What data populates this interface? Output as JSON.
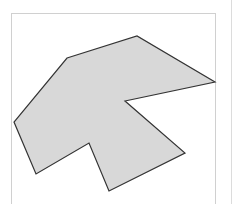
{
  "diagram": {
    "type": "polygon",
    "fill": "#d8d8d8",
    "stroke": "#333333",
    "stroke_width": 1.2,
    "points": [
      [
        67,
        58
      ],
      [
        137,
        36
      ],
      [
        215,
        82
      ],
      [
        125,
        101
      ],
      [
        185,
        153
      ],
      [
        109,
        191
      ],
      [
        89,
        143
      ],
      [
        36,
        174
      ],
      [
        14,
        122
      ]
    ]
  },
  "frame": {
    "border_color": "#d0d0d0"
  },
  "divider": {
    "color": "#dcdcdc"
  }
}
